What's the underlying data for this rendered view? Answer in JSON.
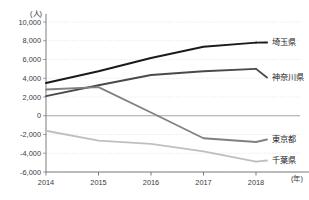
{
  "chart_data": {
    "type": "line",
    "title": "",
    "subtitle": "",
    "xlabel": "(年)",
    "ylabel": "(人)",
    "x": [
      2014,
      2015,
      2016,
      2017,
      2018
    ],
    "xticklabels": [
      "2014",
      "2015",
      "2016",
      "2017",
      "2018"
    ],
    "yticklabels": [
      "10,000",
      "8,000",
      "6,000",
      "4,000",
      "2,000",
      "0",
      "-2,000",
      "-4,000",
      "-6,000"
    ],
    "yticks": [
      10000,
      8000,
      6000,
      4000,
      2000,
      0,
      -2000,
      -4000,
      -6000
    ],
    "ylim": [
      -6000,
      10000
    ],
    "xlim": [
      2014,
      2018
    ],
    "grid": true,
    "grid_style": "dotted-horizontal",
    "legend_position": "right-inline-labels",
    "series": [
      {
        "name": "埼玉県",
        "color": "#1a1a1a",
        "width": 2.0,
        "values": [
          3500,
          4750,
          6150,
          7350,
          7800
        ]
      },
      {
        "name": "神奈川県",
        "color": "#4a4a4a",
        "width": 1.9,
        "values": [
          2100,
          3250,
          4350,
          4750,
          5000
        ]
      },
      {
        "name": "東京都",
        "color": "#808080",
        "width": 1.8,
        "values": [
          2800,
          3050,
          350,
          -2400,
          -2800
        ]
      },
      {
        "name": "千葉県",
        "color": "#bfbfbf",
        "width": 1.8,
        "values": [
          -1600,
          -2650,
          -3000,
          -3800,
          -4900
        ]
      }
    ]
  },
  "axis": {
    "unit_y": "(人)",
    "unit_x": "(年)"
  }
}
